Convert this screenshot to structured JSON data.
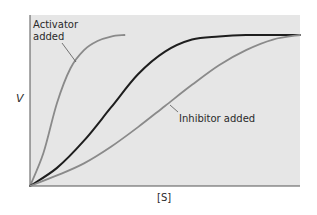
{
  "chart_data": {
    "type": "line",
    "title": "",
    "xlabel": "[S]",
    "ylabel": "V",
    "xlim": [
      0,
      1
    ],
    "ylim": [
      0,
      1
    ],
    "grid": false,
    "background_color": "#e6e6e6",
    "series": [
      {
        "name": "Activator added",
        "color": "#8a8a8a",
        "x": [
          0,
          0.05,
          0.1,
          0.15,
          0.2,
          0.25,
          0.3,
          0.35
        ],
        "y": [
          0,
          0.22,
          0.55,
          0.78,
          0.9,
          0.96,
          0.99,
          1.0
        ]
      },
      {
        "name": "Normal",
        "color": "#1e1e1e",
        "x": [
          0,
          0.1,
          0.2,
          0.3,
          0.4,
          0.5,
          0.6,
          0.7,
          0.8,
          0.9,
          1.0
        ],
        "y": [
          0,
          0.12,
          0.3,
          0.52,
          0.74,
          0.89,
          0.97,
          0.99,
          1.0,
          1.0,
          1.0
        ]
      },
      {
        "name": "Inhibitor added",
        "color": "#8a8a8a",
        "x": [
          0,
          0.1,
          0.2,
          0.3,
          0.4,
          0.5,
          0.6,
          0.7,
          0.8,
          0.9,
          1.0
        ],
        "y": [
          0,
          0.07,
          0.15,
          0.26,
          0.39,
          0.53,
          0.67,
          0.8,
          0.9,
          0.97,
          1.0
        ]
      }
    ],
    "annotations": [
      {
        "text_lines": [
          "Activator",
          "added"
        ],
        "target_series": "Activator added"
      },
      {
        "text_lines": [
          "Inhibitor added"
        ],
        "target_series": "Inhibitor added"
      }
    ]
  }
}
